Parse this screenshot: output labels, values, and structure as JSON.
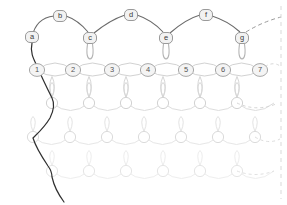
{
  "diagram": {
    "colors": {
      "dark_path": "#2b2b2b",
      "top_arc": "#5a5a5a",
      "node_stroke": "#8a8a8a",
      "node_fill": "#f2f2f2",
      "mesh_light": "#d8d8d8",
      "mesh_lighter": "#e6e6e6",
      "mesh_faint": "#efefef",
      "dashed": "#cfcfcf",
      "label_text": "#3a3a3a",
      "background": "#ffffff"
    },
    "top_row": {
      "name": "letter-node-row",
      "nodes": [
        {
          "label": "a",
          "x": 32,
          "y": 37,
          "tier": "low",
          "has_stem_loop": false
        },
        {
          "label": "b",
          "x": 60,
          "y": 16,
          "tier": "high",
          "has_stem_loop": false
        },
        {
          "label": "c",
          "x": 90,
          "y": 38,
          "tier": "low",
          "has_stem_loop": true
        },
        {
          "label": "d",
          "x": 131,
          "y": 15,
          "tier": "high",
          "has_stem_loop": false
        },
        {
          "label": "e",
          "x": 166,
          "y": 38,
          "tier": "low",
          "has_stem_loop": true
        },
        {
          "label": "f",
          "x": 206,
          "y": 15,
          "tier": "high",
          "has_stem_loop": false
        },
        {
          "label": "g",
          "x": 242,
          "y": 38,
          "tier": "low",
          "has_stem_loop": true
        }
      ]
    },
    "number_row": {
      "name": "numbered-node-row",
      "y": 70,
      "nodes": [
        {
          "label": "1",
          "x": 37
        },
        {
          "label": "2",
          "x": 73
        },
        {
          "label": "3",
          "x": 112
        },
        {
          "label": "4",
          "x": 148
        },
        {
          "label": "5",
          "x": 186
        },
        {
          "label": "6",
          "x": 223
        },
        {
          "label": "7",
          "x": 260
        }
      ]
    },
    "mesh": {
      "name": "repeating-lattice-mesh",
      "rows": [
        {
          "y": 103,
          "x_start": 52,
          "spacing": 37,
          "count": 7,
          "opacity": 0.55
        },
        {
          "y": 137,
          "x_start": 33,
          "spacing": 37,
          "count": 7,
          "opacity": 0.42
        },
        {
          "y": 171,
          "x_start": 52,
          "spacing": 37,
          "count": 7,
          "opacity": 0.32
        }
      ]
    },
    "edges": {
      "selvage_label": "dark-selvage-path",
      "dashed_right_label": "dashed-continuation-edge",
      "dashed_top_label": "dashed-top-continuation"
    }
  }
}
